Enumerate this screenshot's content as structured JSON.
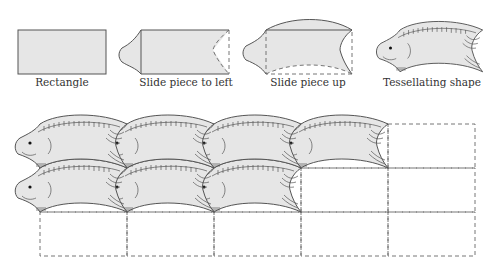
{
  "steps": [
    {
      "id": "rectangle",
      "label": "Rectangle"
    },
    {
      "id": "slide-left",
      "label": "Slide piece to left"
    },
    {
      "id": "slide-up",
      "label": "Slide piece up"
    },
    {
      "id": "tessellating",
      "label": "Tessellating shape"
    }
  ],
  "grid": {
    "columns": 5,
    "rows": 3,
    "filled_cells": [
      [
        0,
        0
      ],
      [
        1,
        0
      ],
      [
        2,
        0
      ],
      [
        3,
        0
      ],
      [
        0,
        1
      ],
      [
        1,
        1
      ],
      [
        2,
        1
      ]
    ],
    "fill_color": "#e6e6e6",
    "line_color": "#555555"
  }
}
